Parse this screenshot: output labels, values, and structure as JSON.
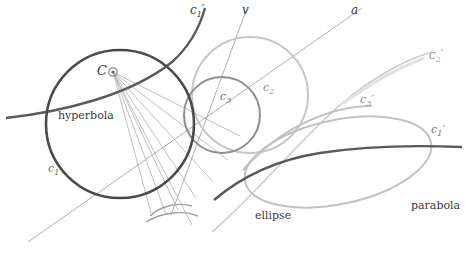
{
  "figure": {
    "background": "#ffffff",
    "colors": {
      "dark_curve": "#4a4a4a",
      "mid_curve": "#8c8c8c",
      "light_curve": "#bdbdbd",
      "thin_line": "#a8a8a8",
      "label_text": "#3a3a3a"
    },
    "labels": [
      {
        "id": "c1-prime-top",
        "text": "c₁′",
        "display": "c",
        "sub": "1",
        "prime": true,
        "x": 193,
        "y": 10,
        "italic": true
      },
      {
        "id": "v-axis",
        "text": "v",
        "display": "v",
        "sub": "",
        "prime": false,
        "x": 243,
        "y": 10,
        "italic": true
      },
      {
        "id": "a-axis",
        "text": "a",
        "display": "a",
        "sub": "",
        "prime": false,
        "x": 352,
        "y": 10,
        "italic": true
      },
      {
        "id": "c2-prime",
        "text": "c₂′",
        "display": "c",
        "sub": "2",
        "prime": true,
        "x": 432,
        "y": 55,
        "italic": true
      },
      {
        "id": "center-C",
        "text": "C",
        "display": "C",
        "sub": "",
        "prime": false,
        "x": 100,
        "y": 70,
        "italic": true
      },
      {
        "id": "c2",
        "text": "c₂",
        "display": "c",
        "sub": "2",
        "prime": false,
        "x": 265,
        "y": 88,
        "italic": true
      },
      {
        "id": "c3",
        "text": "c₃",
        "display": "c",
        "sub": "3",
        "prime": false,
        "x": 222,
        "y": 97,
        "italic": true
      },
      {
        "id": "c3-prime",
        "text": "c₃′",
        "display": "c",
        "sub": "3",
        "prime": true,
        "x": 362,
        "y": 100,
        "italic": true
      },
      {
        "id": "hyperbola",
        "text": "hyperbola",
        "display": "hyperbola",
        "sub": "",
        "prime": false,
        "x": 60,
        "y": 116,
        "italic": false
      },
      {
        "id": "c1-prime-right",
        "text": "c₁′",
        "display": "c",
        "sub": "1",
        "prime": true,
        "x": 433,
        "y": 130,
        "italic": true
      },
      {
        "id": "c1",
        "text": "c₁",
        "display": "c",
        "sub": "1",
        "prime": false,
        "x": 50,
        "y": 169,
        "italic": true
      },
      {
        "id": "ellipse",
        "text": "ellipse",
        "display": "ellipse",
        "sub": "",
        "prime": false,
        "x": 257,
        "y": 216,
        "italic": false
      },
      {
        "id": "parabola",
        "text": "parabola",
        "display": "parabola",
        "sub": "",
        "prime": false,
        "x": 413,
        "y": 206,
        "italic": false
      }
    ],
    "elements": {
      "circle_c1": {
        "cx": 120,
        "cy": 124,
        "r": 74,
        "stroke": "#4a4a4a"
      },
      "circle_c3": {
        "cx": 222,
        "cy": 115,
        "r": 38,
        "stroke": "#8c8c8c"
      },
      "circle_c2": {
        "cx": 250,
        "cy": 95,
        "r": 58,
        "stroke": "#c9c9c9"
      },
      "center_point": {
        "x": 113,
        "y": 72,
        "label": "C"
      },
      "vertex_point": {
        "x": 168,
        "y": 212
      }
    }
  }
}
